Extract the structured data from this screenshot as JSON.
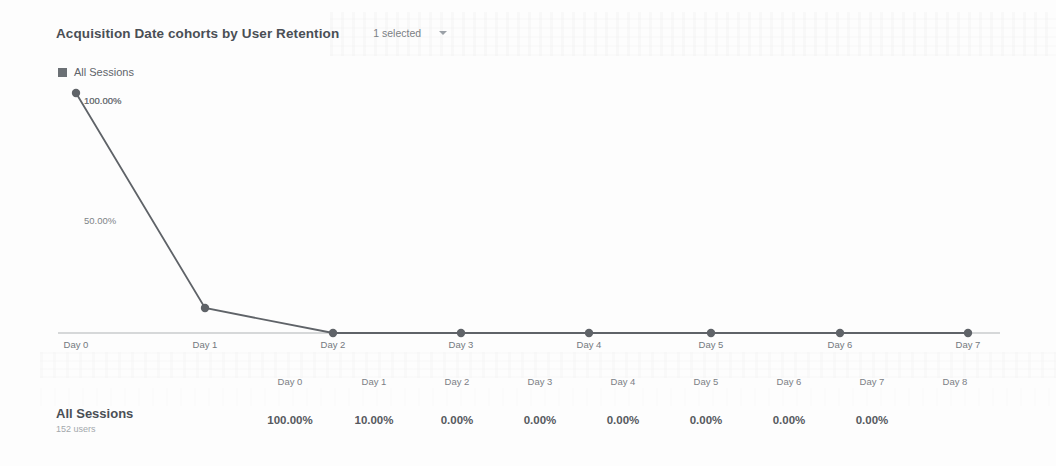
{
  "header": {
    "title": "Acquisition Date cohorts by User Retention",
    "segment_label": "1 selected",
    "chevron_icon": "chevron-down-icon"
  },
  "legend": {
    "entries": [
      {
        "label": "All Sessions",
        "color": "#6b7075",
        "marker": "square"
      }
    ]
  },
  "chart_data": {
    "type": "line",
    "title": "Acquisition Date cohorts by User Retention",
    "xlabel": "",
    "ylabel": "",
    "categories": [
      "Day 0",
      "Day 1",
      "Day 2",
      "Day 3",
      "Day 4",
      "Day 5",
      "Day 6",
      "Day 7"
    ],
    "series": [
      {
        "name": "All Sessions",
        "values": [
          100.0,
          10.0,
          0.0,
          0.0,
          0.0,
          0.0,
          0.0,
          0.0
        ],
        "color": "#5f6368"
      }
    ],
    "ytick_labels": [
      "100.00%",
      "50.00%"
    ],
    "ytick_values": [
      100,
      50
    ],
    "ylim": [
      0,
      100
    ],
    "grid": false,
    "legend_position": "top-left",
    "point_annotations": [
      {
        "category": "Day 0",
        "text": "100.00%"
      }
    ]
  },
  "table": {
    "columns": [
      "Day 0",
      "Day 1",
      "Day 2",
      "Day 3",
      "Day 4",
      "Day 5",
      "Day 6",
      "Day 7",
      "Day 8"
    ],
    "rows": [
      {
        "name": "All Sessions",
        "subtitle": "152 users",
        "values": [
          "100.00%",
          "10.00%",
          "0.00%",
          "0.00%",
          "0.00%",
          "0.00%",
          "0.00%",
          "0.00%",
          ""
        ]
      }
    ]
  },
  "geometry": {
    "chart_point_x": [
      76,
      205,
      333,
      461,
      589,
      711,
      840,
      968
    ],
    "chart_point_y": [
      93,
      308,
      333,
      333,
      333,
      333,
      333,
      333
    ],
    "axis_y": 333,
    "axis_x_start": 58,
    "axis_x_end": 1000,
    "y_label_pos": [
      {
        "text": "100.00%",
        "x": 84,
        "y": 95
      },
      {
        "text": "50.00%",
        "x": 84,
        "y": 215
      }
    ],
    "table_col_x": [
      290,
      374,
      457,
      540,
      623,
      706,
      789,
      872,
      955
    ],
    "table_header_y": 14,
    "table_value_y": 52
  }
}
